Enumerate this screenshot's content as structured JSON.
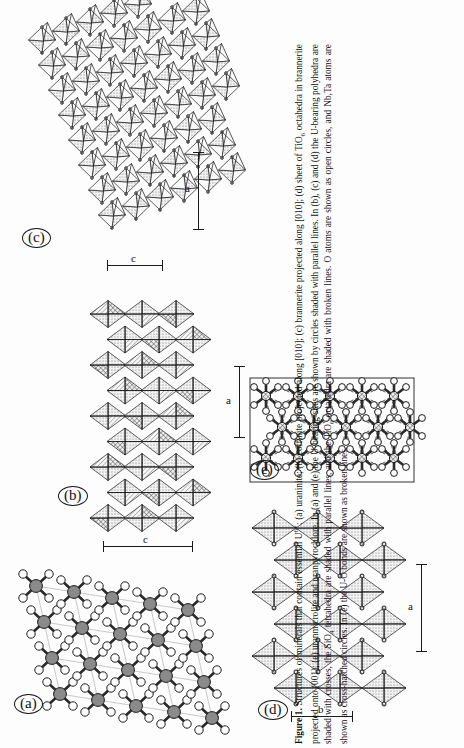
{
  "figure": {
    "number": "Figure 1.",
    "caption_runs": [
      {
        "t": "Figure 1.",
        "bold": true
      },
      {
        "t": " Structures of minerals that contain essential U",
        "bold": false
      },
      {
        "t": "6+",
        "sup": true
      },
      {
        "t": ": (a) uraninite; (b) coffinite projected along [010]; (c) brannerite projected along [010]; (d) sheet of TiO",
        "bold": false
      },
      {
        "t": "6",
        "sub": true
      },
      {
        "t": " octahedra in brannerite projected onto (001); (e) uranmicrolite and uranpyrochlore. In (a) and (e) the U-bearing sites are shown by circles shaded with parallel lines. In (b), (c) and (d) the U-bearing polyhedra are shaded with crosses, the SiO",
        "bold": false
      },
      {
        "t": "4",
        "sub": true
      },
      {
        "t": " tetrahedra are shaded with parallel lines, and the TiO",
        "bold": false
      },
      {
        "t": "6",
        "sub": true
      },
      {
        "t": " octahedra are shaded with broken lines. O atoms are shown as open circles, and Nb,Ta atoms are shown as cross-hatched circles. In (e) the U-O bonds are shown as broken lines.",
        "bold": false
      }
    ],
    "caption_plain": "Figure 1. Structures of minerals that contain essential U6+: (a) uraninite; (b) coffinite projected along [010]; (c) brannerite projected along [010]; (d) sheet of TiO6 octahedra in brannerite projected onto (001); (e) uranmicrolite and uranpyrochlore. In (a) and (e) the U-bearing sites are shown by circles shaded with parallel lines. In (b), (c) and (d) the U-bearing polyhedra are shaded with crosses, the SiO4 tetrahedra are shaded with parallel lines, and the TiO6 octahedra are shaded with broken lines. O atoms are shown as open circles, and Nb,Ta atoms are shown as cross-hatched circles. In (e) the U-O bonds are shown as broken lines."
  },
  "panels": [
    {
      "id": "a",
      "label": "(a)",
      "name": "uraninite",
      "scale_bars": []
    },
    {
      "id": "b",
      "label": "(b)",
      "name": "coffinite",
      "scale_bars": [
        {
          "axis": "c"
        }
      ]
    },
    {
      "id": "c",
      "label": "(c)",
      "name": "brannerite",
      "scale_bars": [
        {
          "axis": "c"
        },
        {
          "axis": "a"
        }
      ]
    },
    {
      "id": "d",
      "label": "(d)",
      "name": "brannerite-TiO6-sheet",
      "scale_bars": [
        {
          "axis": "a"
        },
        {
          "axis": "b"
        }
      ]
    },
    {
      "id": "e",
      "label": "(e)",
      "name": "uranmicrolite-uranpyrochlore",
      "scale_bars": [
        {
          "axis": "a"
        }
      ]
    }
  ],
  "axis_labels": {
    "a": "a",
    "b": "b",
    "c": "c"
  },
  "colors": {
    "ink": "#1b1b1b",
    "page": "#fdfdfd",
    "shade_fill": "#cfcfcf",
    "atom_fill": "#ffffff",
    "bond": "#2a2a2a"
  }
}
